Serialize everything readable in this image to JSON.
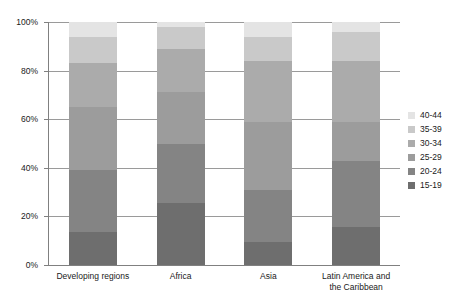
{
  "chart_data": {
    "type": "bar",
    "subtype": "stacked-percentage-column",
    "title": "",
    "subtitle": "",
    "xlabel": "",
    "ylabel": "",
    "categories": [
      "Developing regions",
      "Africa",
      "Asia",
      "Latin America and the Caribbean"
    ],
    "series": [
      {
        "name": "15-19",
        "color": "#6e6e6e",
        "values": [
          13.5,
          25.5,
          9.5,
          15.5
        ]
      },
      {
        "name": "20-24",
        "color": "#848484",
        "values": [
          25.5,
          24.5,
          21.5,
          27.5
        ]
      },
      {
        "name": "25-29",
        "color": "#9c9c9c",
        "values": [
          26.0,
          21.0,
          28.0,
          16.0
        ]
      },
      {
        "name": "30-34",
        "color": "#ababab",
        "values": [
          18.0,
          18.0,
          25.0,
          25.0
        ]
      },
      {
        "name": "35-39",
        "color": "#c9c9c9",
        "values": [
          11.0,
          9.0,
          10.0,
          12.0
        ]
      },
      {
        "name": "40-44",
        "color": "#e4e4e4",
        "values": [
          6.0,
          2.0,
          6.0,
          4.0
        ]
      }
    ],
    "ylim": [
      0,
      100
    ],
    "y_ticks": [
      "0%",
      "20%",
      "40%",
      "60%",
      "80%",
      "100%"
    ],
    "y_tick_values": [
      0,
      20,
      40,
      60,
      80,
      100
    ],
    "grid": true,
    "grid_axis": "y",
    "legend_position": "right",
    "legend_order": [
      "40-44",
      "35-39",
      "30-34",
      "25-29",
      "20-24",
      "15-19"
    ],
    "axis_color": "#808080",
    "gridline_color": "#9a9a9a",
    "background_color": "#ffffff"
  },
  "axes": {
    "y_tick_labels": [
      {
        "label": "100%",
        "value": 100
      },
      {
        "label": "80%",
        "value": 80
      },
      {
        "label": "60%",
        "value": 60
      },
      {
        "label": "40%",
        "value": 40
      },
      {
        "label": "20%",
        "value": 20
      },
      {
        "label": "0%",
        "value": 0
      }
    ],
    "x_tick_labels": [
      {
        "line1": "Developing regions",
        "line2": ""
      },
      {
        "line1": "Africa",
        "line2": ""
      },
      {
        "line1": "Asia",
        "line2": ""
      },
      {
        "line1": "Latin America and",
        "line2": "the Caribbean"
      }
    ]
  },
  "legend": {
    "items": [
      {
        "label": "40-44",
        "color": "#e4e4e4"
      },
      {
        "label": "35-39",
        "color": "#c9c9c9"
      },
      {
        "label": "30-34",
        "color": "#ababab"
      },
      {
        "label": "25-29",
        "color": "#9c9c9c"
      },
      {
        "label": "20-24",
        "color": "#848484"
      },
      {
        "label": "15-19",
        "color": "#6e6e6e"
      }
    ]
  }
}
